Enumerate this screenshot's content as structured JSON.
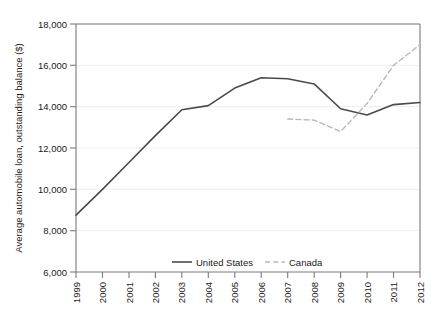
{
  "chart_data": {
    "type": "line",
    "title": "",
    "xlabel": "",
    "ylabel": "Average automobile loan, outstanding balance ($)",
    "x": [
      1999,
      2000,
      2001,
      2002,
      2003,
      2004,
      2005,
      2006,
      2007,
      2008,
      2009,
      2010,
      2011,
      2012
    ],
    "categories": [
      "1999",
      "2000",
      "2001",
      "2002",
      "2003",
      "2004",
      "2005",
      "2006",
      "2007",
      "2008",
      "2009",
      "2010",
      "2011",
      "2012"
    ],
    "ylim": [
      6000,
      18000
    ],
    "xlim": [
      1999,
      2012
    ],
    "yticks": [
      6000,
      8000,
      10000,
      12000,
      14000,
      16000,
      18000
    ],
    "ytick_labels": [
      "6,000",
      "8,000",
      "10,000",
      "12,000",
      "14,000",
      "16,000",
      "18,000"
    ],
    "grid": true,
    "grid_axis": "y",
    "legend_position": "bottom-center",
    "series": [
      {
        "name": "United States",
        "style": "solid",
        "color": "#4a4a4a",
        "x": [
          1999,
          2000,
          2001,
          2002,
          2003,
          2004,
          2005,
          2006,
          2007,
          2008,
          2009,
          2010,
          2011,
          2012
        ],
        "values": [
          8750,
          10000,
          11300,
          12600,
          13850,
          14050,
          14900,
          15400,
          15350,
          15100,
          13900,
          13600,
          14100,
          14200
        ]
      },
      {
        "name": "Canada",
        "style": "dashed",
        "color": "#b8b8b8",
        "x": [
          2007,
          2008,
          2009,
          2010,
          2011,
          2012
        ],
        "values": [
          13400,
          13350,
          12800,
          14150,
          16000,
          17000
        ]
      }
    ]
  },
  "legend": {
    "items": [
      {
        "label": "United States",
        "style": "solid",
        "color": "#4a4a4a"
      },
      {
        "label": "Canada",
        "style": "dashed",
        "color": "#b8b8b8"
      }
    ]
  },
  "axes": {
    "y_title": "Average automobile loan, outstanding balance ($)",
    "y_tick_labels": [
      "18,000",
      "16,000",
      "14,000",
      "12,000",
      "10,000",
      "8,000",
      "6,000"
    ],
    "x_tick_labels": [
      "1999",
      "2000",
      "2001",
      "2002",
      "2003",
      "2004",
      "2005",
      "2006",
      "2007",
      "2008",
      "2009",
      "2010",
      "2011",
      "2012"
    ]
  },
  "colors": {
    "background": "#ffffff",
    "axis": "#6e6e6e",
    "grid": "#eaeaea",
    "text": "#1a1a1a",
    "series_us": "#4a4a4a",
    "series_canada": "#b8b8b8"
  }
}
